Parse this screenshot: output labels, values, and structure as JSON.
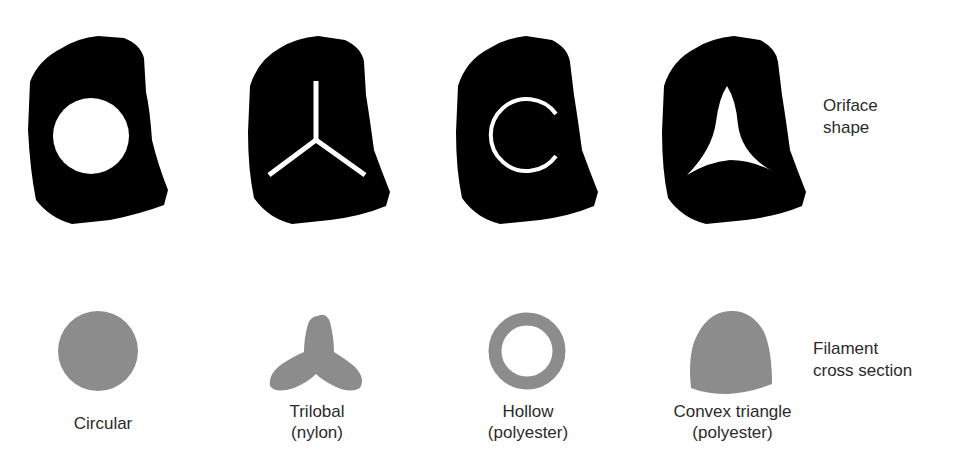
{
  "figure": {
    "row_labels": {
      "orifice": [
        "Oriface",
        "shape"
      ],
      "filament": [
        "Filament",
        "cross section"
      ]
    },
    "items": [
      {
        "name": "circular",
        "label_lines": [
          "Circular"
        ],
        "orifice_shape": "circle-hole",
        "cross_section": "solid-circle"
      },
      {
        "name": "trilobal",
        "label_lines": [
          "Trilobal",
          "(nylon)"
        ],
        "orifice_shape": "y-slot",
        "cross_section": "trilobal"
      },
      {
        "name": "hollow",
        "label_lines": [
          "Hollow",
          "(polyester)"
        ],
        "orifice_shape": "c-slot",
        "cross_section": "ring"
      },
      {
        "name": "convex-triangle",
        "label_lines": [
          "Convex triangle",
          "(polyester)"
        ],
        "orifice_shape": "concave-triangle-hole",
        "cross_section": "convex-triangle"
      }
    ],
    "colors": {
      "die_plate": "#000000",
      "orifice": "#ffffff",
      "filament": "#8c8c8c",
      "text": "#2b2b2b",
      "background": "#ffffff"
    }
  }
}
